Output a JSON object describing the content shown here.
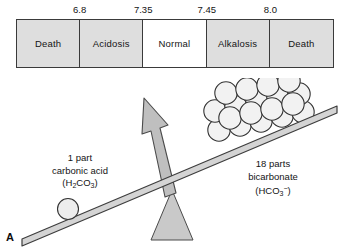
{
  "figure": {
    "panel_letter": "A",
    "background_color": "#ffffff",
    "line_color": "#3a3a3a",
    "shade_color": "#dedede"
  },
  "ph_scale": {
    "cells": [
      {
        "label": "Death",
        "fill": "shaded"
      },
      {
        "label": "Acidosis",
        "fill": "shaded"
      },
      {
        "label": "Normal",
        "fill": "clear"
      },
      {
        "label": "Alkalosis",
        "fill": "shaded"
      },
      {
        "label": "Death",
        "fill": "shaded"
      }
    ],
    "ticks": [
      {
        "value": "6.8",
        "position_pct": 20
      },
      {
        "value": "7.35",
        "position_pct": 40
      },
      {
        "value": "7.45",
        "position_pct": 60
      },
      {
        "value": "8.0",
        "position_pct": 80
      }
    ]
  },
  "balance": {
    "left": {
      "amount": "1 part",
      "name": "carbonic acid",
      "formula_prefix": "(H",
      "formula_sub1": "2",
      "formula_mid": "CO",
      "formula_sub2": "3",
      "formula_suffix": ")",
      "circle_count": 1
    },
    "right": {
      "amount": "18 parts",
      "name": "bicarbonate",
      "formula_prefix": "(HCO",
      "formula_sub1": "3",
      "formula_sup": "−",
      "formula_suffix": ")",
      "circle_count": 18
    },
    "arrow_direction": "up-left",
    "tilt": "right-side-down"
  }
}
